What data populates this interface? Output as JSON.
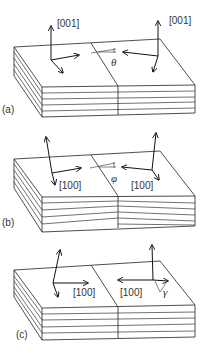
{
  "figure": {
    "panels": [
      {
        "id": "a",
        "label": "(a)",
        "left_axis_label": "[001]",
        "right_axis_label": "[001]",
        "angle_symbol": "θ",
        "description": "tilt about boundary, layers continuous"
      },
      {
        "id": "b",
        "label": "(b)",
        "left_axis_label": "[100]",
        "right_axis_label": "[100]",
        "angle_symbol": "φ",
        "description": "layers inclined across boundary"
      },
      {
        "id": "c",
        "label": "(c)",
        "left_axis_label": "[100]",
        "right_axis_label": "[100]",
        "angle_symbol": "γ",
        "description": "opposite in-plane axes"
      }
    ]
  }
}
